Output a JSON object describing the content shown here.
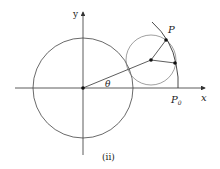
{
  "labels": {
    "y_axis": "y",
    "x_axis": "x",
    "point_p": "P",
    "point_p0_main": "P",
    "point_p0_sub": "0",
    "angle": "θ",
    "caption": "(ii)"
  },
  "geometry": {
    "origin": [
      83,
      88
    ],
    "fixed_circle_radius": 50,
    "rolling_circle_center": [
      151,
      60
    ],
    "rolling_circle_radius": 25,
    "point_P": [
      166,
      40
    ],
    "contact_point": [
      175,
      63
    ],
    "point_P0": [
      178,
      88
    ]
  },
  "colors": {
    "line": "#333333",
    "circle": "#555555"
  }
}
